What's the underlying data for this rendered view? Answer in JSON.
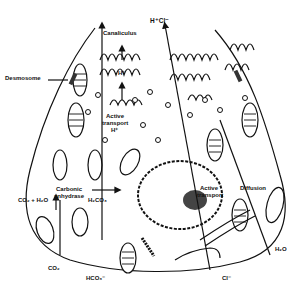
{
  "diagram": {
    "labels": {
      "hcl": "H⁺Cl⁻",
      "canaliculus": "Canaliculus",
      "desmosome": "Desmosome",
      "h_plus": "H⁺",
      "active_transport_h_line1": "Active",
      "active_transport_h_line2": "transport",
      "active_transport_h_line3": "H⁺",
      "carbonic_anhydrase_line1": "Carbonic",
      "carbonic_anhydrase_line2": "anhydrase",
      "co2_h2o": "CO₂ + H₂O",
      "h2co3": "H₂CO₃",
      "active_transport_cl_line1": "Active",
      "active_transport_cl_line2": "transport",
      "diffusion": "Diffusion",
      "h2o": "H₂O",
      "co2": "CO₂",
      "hco3": "HCO₃⁻",
      "cl": "Cl⁻"
    },
    "colors": {
      "ink": "#111111",
      "background": "#ffffff"
    }
  }
}
